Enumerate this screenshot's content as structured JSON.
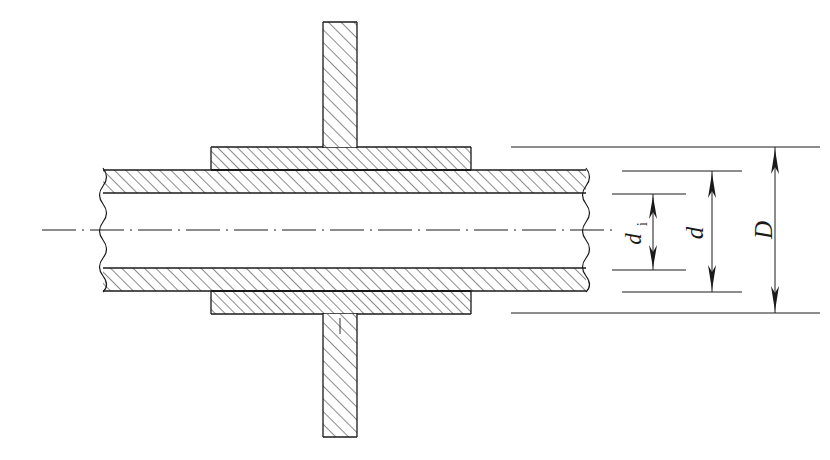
{
  "drawing": {
    "title": "Pipe with sleeve / flange cross-section",
    "type": "engineering-section-view",
    "background_color": "#ffffff",
    "line_color": "#1a1a1a",
    "hatch_color": "#2b2b2b",
    "dimensions": [
      {
        "id": "di",
        "symbol": "d",
        "subscript": "i",
        "meaning": "inner diameter of pipe bore",
        "label_rotation_deg": -90,
        "arrow_style": "double-ended-solid",
        "measured_from_y": 193,
        "measured_to_y": 268
      },
      {
        "id": "d",
        "symbol": "d",
        "subscript": "",
        "meaning": "outer diameter of pipe",
        "label_rotation_deg": -90,
        "arrow_style": "double-ended-solid",
        "measured_from_y": 170,
        "measured_to_y": 290
      },
      {
        "id": "D",
        "symbol": "D",
        "subscript": "",
        "meaning": "outer diameter of sleeve",
        "label_rotation_deg": -90,
        "arrow_style": "double-ended-solid",
        "measured_from_y": 147,
        "measured_to_y": 313
      }
    ],
    "features": [
      {
        "name": "pipe-wall-upper",
        "hatched": true,
        "hatch_angle_deg": 45
      },
      {
        "name": "pipe-wall-lower",
        "hatched": true,
        "hatch_angle_deg": 45
      },
      {
        "name": "pipe-bore",
        "hatched": false
      },
      {
        "name": "sleeve-upper",
        "hatched": true,
        "hatch_angle_deg": 45
      },
      {
        "name": "sleeve-lower",
        "hatched": true,
        "hatch_angle_deg": 45
      },
      {
        "name": "vertical-web-upper",
        "hatched": true,
        "hatch_angle_deg": 45
      },
      {
        "name": "vertical-web-lower",
        "hatched": true,
        "hatch_angle_deg": 45
      },
      {
        "name": "centre-axis",
        "line_style": "dash-dot"
      },
      {
        "name": "break-line-left",
        "line_style": "wavy"
      },
      {
        "name": "break-line-right",
        "line_style": "wavy"
      }
    ]
  }
}
